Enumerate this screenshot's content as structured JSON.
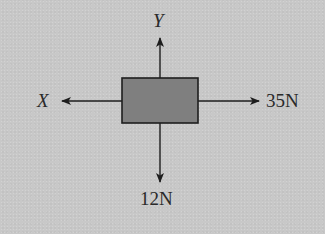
{
  "diagram": {
    "type": "free-body-diagram",
    "colors": {
      "background": "#c8c8c8",
      "box_fill": "#7f7f7f",
      "stroke": "#1e1e1e",
      "text": "#2a2a2a"
    },
    "object": {
      "shape": "rectangle"
    },
    "forces": [
      {
        "direction": "up",
        "label": "Y"
      },
      {
        "direction": "left",
        "label": "X"
      },
      {
        "direction": "right",
        "label": "35N"
      },
      {
        "direction": "down",
        "label": "12N"
      }
    ]
  }
}
